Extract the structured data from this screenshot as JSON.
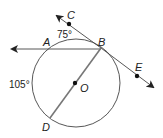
{
  "diagram": {
    "type": "circle-geometry",
    "circle": {
      "center_label": "O",
      "radius_desc": "circle O"
    },
    "points": [
      {
        "id": "A",
        "label": "A"
      },
      {
        "id": "B",
        "label": "B"
      },
      {
        "id": "C",
        "label": "C"
      },
      {
        "id": "D",
        "label": "D"
      },
      {
        "id": "E",
        "label": "E"
      },
      {
        "id": "O",
        "label": "O"
      }
    ],
    "lines": [
      {
        "id": "ray-BA",
        "desc": "secant line through B and A, arrow to the left"
      },
      {
        "id": "tangent-CE",
        "desc": "tangent line at B through C and E, arrows both ends"
      },
      {
        "id": "diameter-BD",
        "desc": "diameter from B through O to D"
      }
    ],
    "angle_labels": {
      "arc_AB": "75°",
      "arc_AD": "105°"
    },
    "colors": {
      "stroke": "#333333",
      "diameter": "#777777"
    }
  }
}
